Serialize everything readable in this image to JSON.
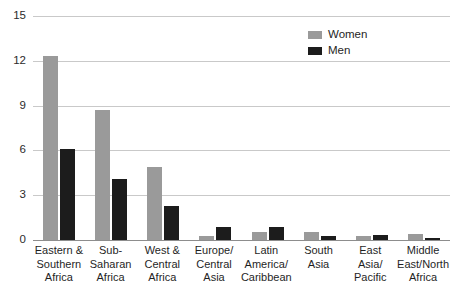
{
  "chart_data": {
    "type": "bar",
    "title": "",
    "xlabel": "",
    "ylabel": "",
    "ylim": [
      0,
      15
    ],
    "yticks": [
      0,
      3,
      6,
      9,
      12,
      15
    ],
    "ytick_labels": [
      "0",
      "3",
      "6",
      "9",
      "12",
      "15"
    ],
    "grid": true,
    "legend_position": "top-right",
    "categories": [
      "Eastern &\nSouthern\nAfrica",
      "Sub-\nSaharan\nAfrica",
      "West &\nCentral\nAfrica",
      "Europe/\nCentral\nAsia",
      "Latin\nAmerica/\nCaribbean",
      "South\nAsia",
      "East\nAsia/\nPacific",
      "Middle\nEast/North\nAfrica"
    ],
    "series": [
      {
        "name": "Women",
        "color": "#9a9a9a",
        "values": [
          12.3,
          8.7,
          4.9,
          0.25,
          0.55,
          0.55,
          0.25,
          0.4
        ]
      },
      {
        "name": "Men",
        "color": "#1c1c1c",
        "values": [
          6.1,
          4.1,
          2.3,
          0.85,
          0.9,
          0.3,
          0.35,
          0.15
        ]
      }
    ]
  },
  "legend": {
    "items": [
      {
        "label": "Women",
        "color": "#9a9a9a"
      },
      {
        "label": "Men",
        "color": "#1c1c1c"
      }
    ]
  },
  "colors": {
    "women": "#9a9a9a",
    "men": "#1c1c1c",
    "gridline": "#c9c9c9",
    "baseline": "#8d8d8d",
    "text": "#1f1f1f",
    "background": "#ffffff"
  }
}
